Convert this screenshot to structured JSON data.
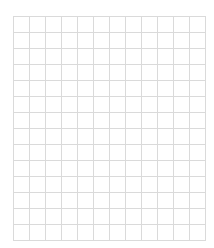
{
  "grid": {
    "columns": 12,
    "rows": 14,
    "cell_size_px": 16,
    "line_color": "#dadada",
    "background_color": "#ffffff"
  }
}
